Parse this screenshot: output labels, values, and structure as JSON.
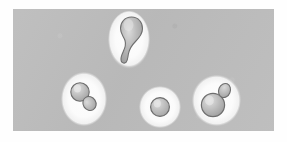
{
  "figure": {
    "title": "Budding yeast cells micrograph",
    "caption": "",
    "width_px": 287,
    "height_px": 142
  },
  "panel": {
    "label": "micrograph-field",
    "background_color": "#bcbcbc",
    "outer_background_color": "#fefefe",
    "left_px": 13,
    "top_px": 9,
    "width_px": 261,
    "height_px": 122
  },
  "palette": {
    "field_gray": "#bcbcbc",
    "halo_white": "#fbfbfb",
    "cell_fill_light": "#d2d2d2",
    "cell_fill_mid": "#b0b0b0",
    "cell_fill_dark": "#9a9a9a",
    "cell_outline": "#6e6e6e",
    "highlight": "#e8e8e8"
  },
  "cells": [
    {
      "id": "cell-top",
      "name": "elongated-budding-cell",
      "description": "Pear / teardrop shaped mother cell with elongated distal bud",
      "bud_count": 1,
      "orientation": "vertical",
      "halo": {
        "shape": "ellipse",
        "width_px": 42,
        "height_px": 58
      },
      "center": {
        "x_px": 129,
        "y_px": 42
      }
    },
    {
      "id": "cell-left",
      "name": "budding-cell-lower-right-bud",
      "description": "Round mother cell with a smaller bud emerging toward the lower right",
      "bud_count": 1,
      "orientation": "diagonal-down-right",
      "halo": {
        "shape": "ellipse",
        "width_px": 46,
        "height_px": 54
      },
      "center": {
        "x_px": 85,
        "y_px": 100
      }
    },
    {
      "id": "cell-middle",
      "name": "single-round-cell",
      "description": "Solitary unbudded round cell",
      "bud_count": 0,
      "orientation": "none",
      "halo": {
        "shape": "circle",
        "width_px": 42,
        "height_px": 42
      },
      "center": {
        "x_px": 161,
        "y_px": 108
      }
    },
    {
      "id": "cell-right",
      "name": "budding-cell-upper-right-bud",
      "description": "Large round mother cell with a small bud emerging toward the upper right",
      "bud_count": 1,
      "orientation": "diagonal-up-right",
      "halo": {
        "shape": "blob",
        "width_px": 50,
        "height_px": 54
      },
      "center": {
        "x_px": 217,
        "y_px": 103
      }
    }
  ],
  "summary": {
    "total_cell_groups": 4,
    "budded_cells": 3,
    "unbudded_cells": 1
  }
}
